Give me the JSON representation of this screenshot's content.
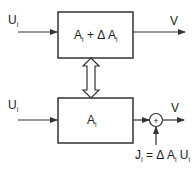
{
  "diagram": {
    "top_block": {
      "input_label": {
        "main": "U",
        "sub": "i"
      },
      "block_label": {
        "a": "A",
        "a_sub": "i",
        "plus": " + ",
        "delta": "Δ",
        "b": " A",
        "b_sub": "i"
      },
      "output_label": "V"
    },
    "coupling_arrow": "double-headed-hollow-arrow",
    "bottom_block": {
      "input_label": {
        "main": "U",
        "sub": "i"
      },
      "block_label": {
        "a": "A",
        "a_sub": "i"
      },
      "sum_symbol": "+",
      "output_label": "V",
      "injection_label": {
        "j": "J",
        "j_sub": "i",
        "eq": " = ",
        "delta": "Δ",
        "a": " A",
        "a_sub": "i",
        "u": " U",
        "u_sub": "i"
      }
    },
    "colors": {
      "stroke": "#333333",
      "text": "#222222",
      "background": "#ffffff"
    }
  }
}
